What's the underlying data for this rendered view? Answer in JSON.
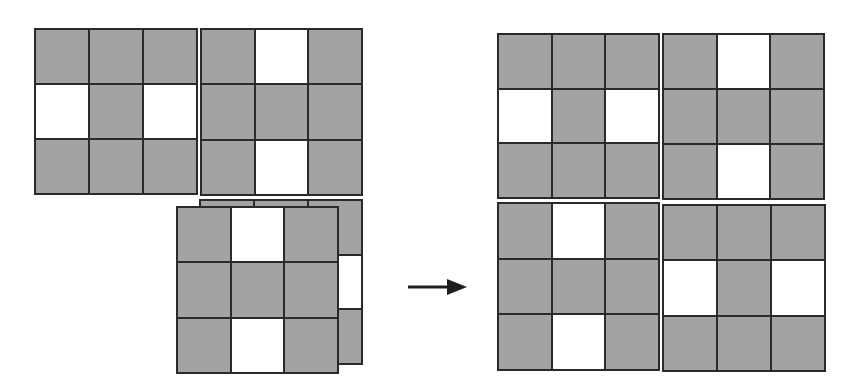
{
  "diagram": {
    "colors": {
      "filled": "#a3a3a3",
      "empty": "#ffffff",
      "line": "#2a2a2a"
    },
    "left_group": {
      "tiles": [
        {
          "id": "A",
          "x": 34,
          "y": 28,
          "w": 164,
          "h": 167,
          "z": 1,
          "pattern": [
            [
              1,
              1,
              1
            ],
            [
              0,
              1,
              0
            ],
            [
              1,
              1,
              1
            ]
          ]
        },
        {
          "id": "B",
          "x": 200,
          "y": 28,
          "w": 163,
          "h": 168,
          "z": 1,
          "pattern": [
            [
              1,
              0,
              1
            ],
            [
              1,
              1,
              1
            ],
            [
              1,
              0,
              1
            ]
          ]
        },
        {
          "id": "D-behind",
          "x": 199,
          "y": 199,
          "w": 164,
          "h": 166,
          "z": 2,
          "pattern": [
            [
              1,
              1,
              1
            ],
            [
              0,
              1,
              0
            ],
            [
              1,
              1,
              1
            ]
          ]
        },
        {
          "id": "C-front",
          "x": 176,
          "y": 206,
          "w": 163,
          "h": 168,
          "z": 3,
          "pattern": [
            [
              1,
              0,
              1
            ],
            [
              1,
              1,
              1
            ],
            [
              1,
              0,
              1
            ]
          ]
        }
      ]
    },
    "arrow": {
      "x1": 408,
      "y1": 287,
      "x2": 467,
      "y2": 287,
      "direction": "right"
    },
    "right_group": {
      "tiles": [
        {
          "id": "A",
          "x": 497,
          "y": 33,
          "w": 163,
          "h": 166,
          "pattern": [
            [
              1,
              1,
              1
            ],
            [
              0,
              1,
              0
            ],
            [
              1,
              1,
              1
            ]
          ]
        },
        {
          "id": "B",
          "x": 662,
          "y": 33,
          "w": 163,
          "h": 167,
          "pattern": [
            [
              1,
              0,
              1
            ],
            [
              1,
              1,
              1
            ],
            [
              1,
              0,
              1
            ]
          ]
        },
        {
          "id": "C",
          "x": 497,
          "y": 202,
          "w": 163,
          "h": 169,
          "pattern": [
            [
              1,
              0,
              1
            ],
            [
              1,
              1,
              1
            ],
            [
              1,
              0,
              1
            ]
          ]
        },
        {
          "id": "D",
          "x": 662,
          "y": 204,
          "w": 164,
          "h": 168,
          "pattern": [
            [
              1,
              1,
              1
            ],
            [
              0,
              1,
              0
            ],
            [
              1,
              1,
              1
            ]
          ]
        }
      ]
    }
  }
}
